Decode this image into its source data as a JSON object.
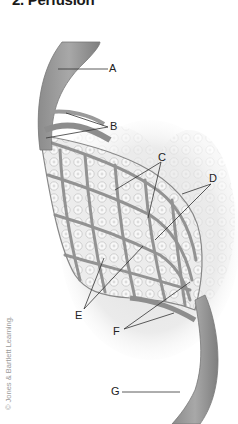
{
  "title": "2. Perfusion",
  "labels": {
    "A": "A",
    "B": "B",
    "C": "C",
    "D": "D",
    "E": "E",
    "F": "F",
    "G": "G"
  },
  "copyright": "© Jones & Bartlett Learning."
}
